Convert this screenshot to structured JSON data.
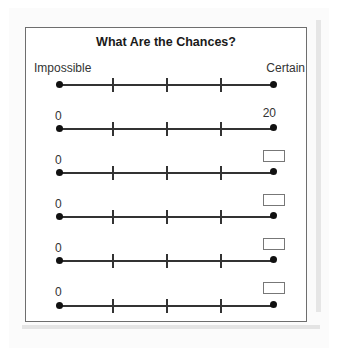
{
  "title": "What Are the Chances?",
  "number_lines": [
    {
      "left_label": "Impossible",
      "right_label": "Certain",
      "right_is_box": false,
      "ticks": 3
    },
    {
      "left_label": "0",
      "right_label": "20",
      "right_is_box": false,
      "ticks": 3
    },
    {
      "left_label": "0",
      "right_label": "",
      "right_is_box": true,
      "ticks": 3
    },
    {
      "left_label": "0",
      "right_label": "",
      "right_is_box": true,
      "ticks": 3
    },
    {
      "left_label": "0",
      "right_label": "",
      "right_is_box": true,
      "ticks": 3
    },
    {
      "left_label": "0",
      "right_label": "",
      "right_is_box": true,
      "ticks": 3
    }
  ]
}
